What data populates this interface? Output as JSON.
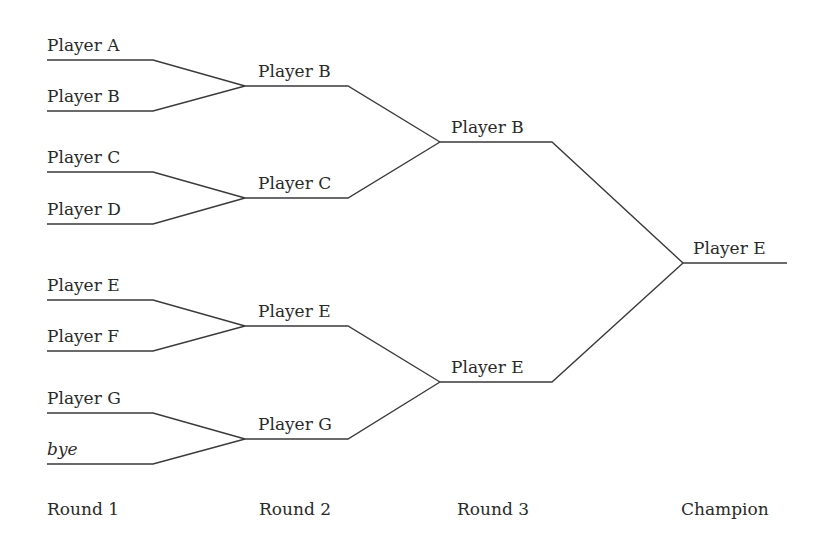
{
  "line_color": "#3a3a3a",
  "rounds": [
    {
      "label": "Round 1",
      "x": 47,
      "label_x": 47,
      "entries": [
        {
          "name": "Player A",
          "y": 60
        },
        {
          "name": "Player B",
          "y": 111
        },
        {
          "name": "Player C",
          "y": 172
        },
        {
          "name": "Player D",
          "y": 224
        },
        {
          "name": "Player E",
          "y": 300
        },
        {
          "name": "Player F",
          "y": 351
        },
        {
          "name": "Player G",
          "y": 413
        },
        {
          "name": "bye",
          "y": 464,
          "italic": true
        }
      ]
    },
    {
      "label": "Round 2",
      "x": 245,
      "label_x": 259,
      "entries": [
        {
          "name": "Player B",
          "y": 86
        },
        {
          "name": "Player C",
          "y": 198
        },
        {
          "name": "Player E",
          "y": 326
        },
        {
          "name": "Player G",
          "y": 439
        }
      ]
    },
    {
      "label": "Round 3",
      "x": 440,
      "label_x": 457,
      "entries": [
        {
          "name": "Player B",
          "y": 142
        },
        {
          "name": "Player E",
          "y": 382
        }
      ]
    },
    {
      "label": "Champion",
      "x": 683,
      "label_x": 681,
      "entries": [
        {
          "name": "Player E",
          "y": 263
        }
      ]
    }
  ],
  "round_label_y": 516
}
